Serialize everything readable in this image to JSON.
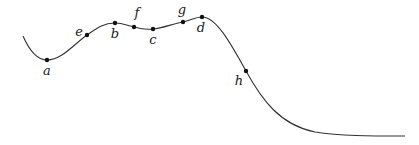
{
  "diagram": {
    "type": "curve-with-labeled-points",
    "curve_color": "#333333",
    "point_color": "#111111",
    "points": [
      {
        "label": "a",
        "x": 47,
        "y": 60,
        "lx": 47,
        "ly": 75
      },
      {
        "label": "e",
        "x": 87,
        "y": 35,
        "lx": 79,
        "ly": 36
      },
      {
        "label": "b",
        "x": 115,
        "y": 23,
        "lx": 115,
        "ly": 38
      },
      {
        "label": "f",
        "x": 134,
        "y": 27,
        "lx": 137,
        "ly": 17
      },
      {
        "label": "c",
        "x": 153,
        "y": 29,
        "lx": 153,
        "ly": 44
      },
      {
        "label": "g",
        "x": 183,
        "y": 22,
        "lx": 182,
        "ly": 14
      },
      {
        "label": "d",
        "x": 202,
        "y": 17,
        "lx": 201,
        "ly": 32
      },
      {
        "label": "h",
        "x": 246,
        "y": 71,
        "lx": 239,
        "ly": 85
      }
    ]
  }
}
